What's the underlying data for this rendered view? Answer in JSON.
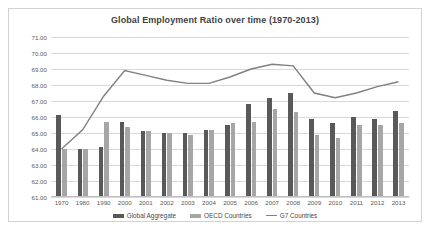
{
  "chart_data": {
    "type": "bar",
    "title": "Global Employment Ratio over time (1970-2013)",
    "xlabel": "",
    "ylabel": "",
    "ylim": [
      61.0,
      71.0
    ],
    "ytick_step": 1.0,
    "ytick_labels": [
      "71.00",
      "70.00",
      "69.00",
      "68.00",
      "67.00",
      "66.00",
      "65.00",
      "64.00",
      "63.00",
      "62.00",
      "61.00"
    ],
    "grid": true,
    "legend_position": "bottom",
    "categories": [
      "1970",
      "1980",
      "1990",
      "2000",
      "2001",
      "2002",
      "2003",
      "2004",
      "2005",
      "2006",
      "2007",
      "2008",
      "2009",
      "2010",
      "2011",
      "2012",
      "2013"
    ],
    "series": [
      {
        "name": "Global Aggregate",
        "type": "bar",
        "color": "#595959",
        "values": [
          66.1,
          64.0,
          64.1,
          65.7,
          65.1,
          65.0,
          65.0,
          65.2,
          65.5,
          66.8,
          67.2,
          67.5,
          65.9,
          65.6,
          66.0,
          65.9,
          66.4
        ]
      },
      {
        "name": "OECD Countries",
        "type": "bar",
        "color": "#a6a6a6",
        "values": [
          64.0,
          64.0,
          65.7,
          65.4,
          65.1,
          65.0,
          64.9,
          65.2,
          65.6,
          65.7,
          66.5,
          66.3,
          64.9,
          64.7,
          65.5,
          65.5,
          65.6
        ]
      },
      {
        "name": "G7 Countries",
        "type": "line",
        "color": "#808080",
        "values": [
          64.0,
          65.2,
          67.3,
          68.9,
          68.6,
          68.3,
          68.1,
          68.1,
          68.5,
          69.0,
          69.3,
          69.2,
          67.5,
          67.2,
          67.5,
          67.9,
          68.2
        ]
      }
    ]
  }
}
